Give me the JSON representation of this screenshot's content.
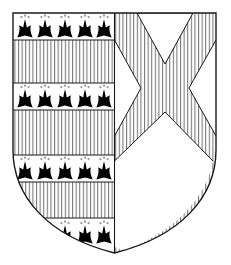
{
  "image": {
    "kind": "heraldic-achievement",
    "title": "Coat of arms (escutcheon)",
    "width": 231,
    "height": 265,
    "background_color": "#ffffff",
    "line_color": "#1a1a1a",
    "hatch_color": "#4a4a4a",
    "charge_color": "#000000"
  },
  "shield": {
    "name": "escutcheon",
    "outline": {
      "top_y": 13,
      "left_x": 13,
      "right_x": 216,
      "shoulder_y": 150,
      "bottom_y": 253,
      "center_x": 114.5
    },
    "division": {
      "name": "per pale",
      "label": "Per pale",
      "divider_x": 114.5
    }
  },
  "dexter_half": {
    "name": "dexter-half",
    "label": "Dexter (viewer's left)",
    "blazon": "Paly, four bars ermine",
    "tincture_hatch": "vertical-lines (gules)",
    "bands": [
      {
        "id": "band-1",
        "type": "ermine-bar",
        "y": 13,
        "height": 27,
        "spots": 5,
        "label": "Ermine bar 1"
      },
      {
        "id": "band-2",
        "type": "hatched-bar",
        "y": 40,
        "height": 43,
        "spots": 0,
        "label": "Hatched bar 1"
      },
      {
        "id": "band-3",
        "type": "ermine-bar",
        "y": 83,
        "height": 27,
        "spots": 5,
        "label": "Ermine bar 2"
      },
      {
        "id": "band-4",
        "type": "hatched-bar",
        "y": 110,
        "height": 45,
        "spots": 0,
        "label": "Hatched bar 2"
      },
      {
        "id": "band-5",
        "type": "ermine-bar",
        "y": 155,
        "height": 27,
        "spots": 5,
        "label": "Ermine bar 3"
      },
      {
        "id": "band-6",
        "type": "hatched-bar",
        "y": 182,
        "height": 36,
        "spots": 0,
        "label": "Hatched bar 3"
      },
      {
        "id": "band-7",
        "type": "ermine-bar",
        "y": 218,
        "height": 30,
        "spots": 3,
        "label": "Ermine bar 4"
      }
    ],
    "ermine_spot": {
      "name": "ermine-spot",
      "label": "Ermine spot",
      "color": "#000000",
      "specks": 3
    },
    "spot_columns_x": [
      25,
      45,
      65,
      85,
      104
    ],
    "bottom_row_spots_x": [
      65,
      85,
      104
    ]
  },
  "sinister_half": {
    "name": "sinister-half",
    "label": "Sinister (viewer's right)",
    "blazon": "A saltire, field and saltire hatched paly",
    "charge": {
      "name": "saltire",
      "label": "Saltire",
      "arm_width": 30,
      "hatched": true
    },
    "field_hatch": "vertical-lines",
    "voids": [
      {
        "id": "void-chief",
        "label": "Chief triangle (plain)"
      },
      {
        "id": "void-dexter",
        "label": "Dexter flank triangle (plain)"
      },
      {
        "id": "void-sinister",
        "label": "Sinister flank triangle (plain)"
      },
      {
        "id": "void-base",
        "label": "Base triangle (plain)"
      }
    ]
  },
  "hatching": {
    "name": "vertical-hatching",
    "label": "Vertical hatching (gules)",
    "spacing": 3.6,
    "stroke_width": 0.85,
    "color": "#555555"
  }
}
